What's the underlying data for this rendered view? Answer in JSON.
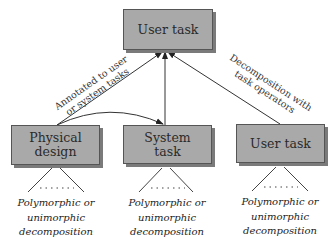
{
  "nodes": {
    "top_user_task": "User task",
    "physical_design": "Physical design",
    "system_task": "System task",
    "right_user_task": "User task"
  },
  "edge_labels": {
    "annotated_line1": "Annotated to user",
    "annotated_line2": "or system tasks",
    "decomposition_line1": "Decomposition with",
    "decomposition_line2": "task operators"
  },
  "captions": {
    "left": [
      "Polymorphic or",
      "unimorphic",
      "decomposition"
    ],
    "middle": [
      "Polymorphic or",
      "unimorphic",
      "decomposition"
    ],
    "right": [
      "Polymorphic or",
      "unimorphic",
      "decomposition"
    ]
  },
  "colors": {
    "box_fill": "#a9a9a9",
    "box_shadow": "#7a7a7a",
    "line": "#333333"
  }
}
